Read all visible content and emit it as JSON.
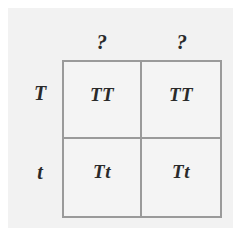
{
  "diagram": {
    "type": "punnett-square",
    "colors": {
      "background": "#ffffff",
      "panel": "#f2f2f2",
      "grid_border": "#9a9a9a",
      "cell_fill": "#f4f4f4",
      "text": "#2a2a2a"
    },
    "column_headers": [
      {
        "label": "?"
      },
      {
        "label": "?"
      }
    ],
    "row_labels": [
      {
        "label": "T"
      },
      {
        "label": "t"
      }
    ],
    "cells": [
      [
        {
          "label": "TT"
        },
        {
          "label": "TT"
        }
      ],
      [
        {
          "label": "Tt"
        },
        {
          "label": "Tt"
        }
      ]
    ]
  }
}
